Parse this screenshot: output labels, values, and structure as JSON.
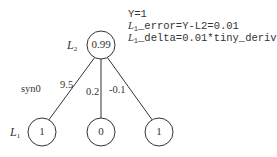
{
  "annotations": {
    "line1": "Y=1",
    "line2_prefix": "L",
    "line2_sub": "1",
    "line2_rest": "_error=Y-L2=0.01",
    "line3_prefix": "L",
    "line3_sub": "1",
    "line3_rest": "_delta=0.01*tiny_deriv"
  },
  "layers": {
    "l2": {
      "label": "L",
      "sub": "2"
    },
    "l1": {
      "label": "L",
      "sub": "1"
    }
  },
  "nodes": {
    "l2_node": "0.99",
    "l1_nodes": [
      "1",
      "0",
      "1"
    ]
  },
  "weights": {
    "name": "syn0",
    "values": [
      "9.5",
      "0.2",
      "-0.1"
    ]
  },
  "colors": {
    "stroke": "#333333",
    "text": "#333333"
  }
}
